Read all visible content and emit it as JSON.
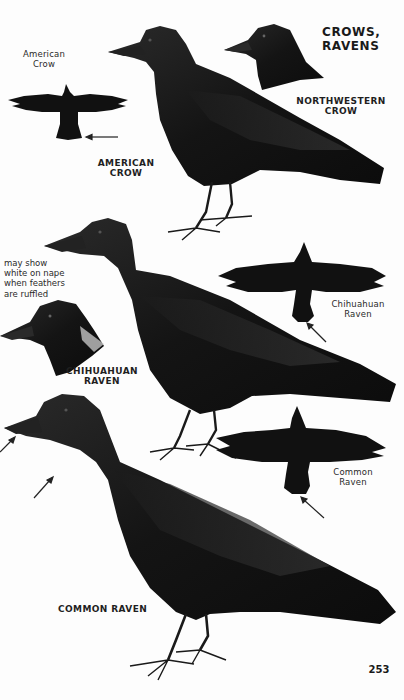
{
  "page": {
    "heading": "CROWS,\nRAVENS",
    "page_number": "253"
  },
  "species": {
    "american_crow": {
      "label": "AMERICAN\nCROW",
      "flight_label": "American\nCrow"
    },
    "northwestern_crow": {
      "label": "NORTHWESTERN\nCROW"
    },
    "chihuahuan_raven": {
      "label": "CHIHUAHUAN\nRAVEN",
      "flight_label": "Chihuahuan\nRaven",
      "note": "may show\nwhite on nape\nwhen feathers\nare ruffled"
    },
    "common_raven": {
      "label": "COMMON RAVEN",
      "flight_label": "Common\nRaven"
    }
  },
  "colors": {
    "ink": "#111111",
    "paper": "#fdfdfd",
    "label": "#1f1f1f"
  }
}
